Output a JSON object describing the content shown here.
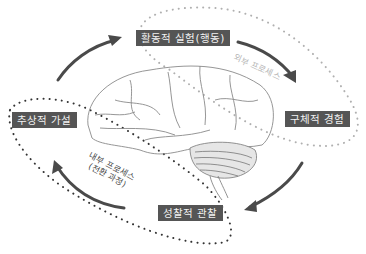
{
  "diagram": {
    "type": "experiential-learning-cycle",
    "nodes": [
      {
        "id": "active_experimentation",
        "label": "활동적 실험(행동)",
        "position": "top"
      },
      {
        "id": "concrete_experience",
        "label": "구체적 경험",
        "position": "right"
      },
      {
        "id": "reflective_observation",
        "label": "성찰적 관찰",
        "position": "bottom"
      },
      {
        "id": "abstract_hypothesis",
        "label": "추상적 가설",
        "position": "left"
      }
    ],
    "edges": [
      {
        "from": "abstract_hypothesis",
        "to": "active_experimentation"
      },
      {
        "from": "active_experimentation",
        "to": "concrete_experience"
      },
      {
        "from": "concrete_experience",
        "to": "reflective_observation"
      },
      {
        "from": "reflective_observation",
        "to": "abstract_hypothesis"
      }
    ],
    "process_labels": {
      "outer": "외부 프로세스",
      "inner_line1": "내부 프로세스",
      "inner_line2": "(전환 과정)"
    },
    "colors": {
      "label_bg": "#555555",
      "label_text": "#f2f2f2",
      "arrow": "#4a4a4a",
      "dots_outer": "#b0b0b0",
      "dots_inner": "#333333",
      "brain_line": "#8a8a8a"
    }
  }
}
